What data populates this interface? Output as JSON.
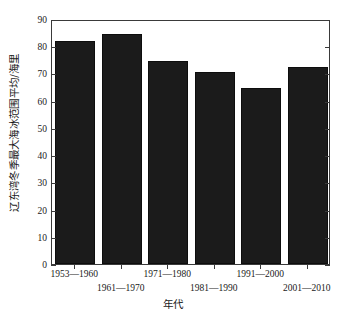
{
  "chart_data": {
    "type": "bar",
    "title": "",
    "xlabel": "年代",
    "ylabel": "辽东湾冬季最大海冰范围平均/海里",
    "categories": [
      "1953—1960",
      "1961—1970",
      "1971—1980",
      "1981—1990",
      "1991—2000",
      "2001—2010"
    ],
    "values": [
      82,
      84.5,
      74.5,
      70.5,
      64.5,
      72.5
    ],
    "ylim": [
      0,
      90
    ],
    "yticks": [
      0,
      10,
      20,
      30,
      40,
      50,
      60,
      70,
      80,
      90
    ],
    "ytick_labels": [
      "0",
      "10",
      "20",
      "30",
      "40",
      "50",
      "60",
      "70",
      "80",
      "90"
    ],
    "grid": false,
    "legend": null,
    "bar_color": "#1b1b1b",
    "axis_color": "#3a3a3a",
    "background": "#ffffff",
    "xlabel_rows": [
      0,
      1,
      0,
      1,
      0,
      1
    ]
  }
}
